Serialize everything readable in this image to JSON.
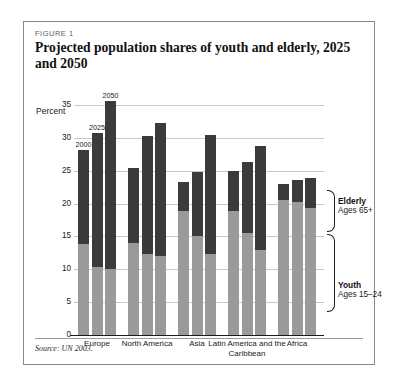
{
  "figure": {
    "label": "FIGURE 1",
    "title": "Projected population shares of youth and elderly, 2025 and 2050",
    "source": "Source: UN 2003."
  },
  "legend": {
    "elderly": {
      "name": "Elderly",
      "sub": "Ages 65+",
      "color": "#3b3b3b"
    },
    "youth": {
      "name": "Youth",
      "sub": "Ages 15–24",
      "color": "#9a9a9a"
    }
  },
  "chart_data": {
    "type": "bar",
    "title": "Projected population shares of youth and elderly, 2025 and 2050",
    "subtype": "stacked-grouped",
    "xlabel": "",
    "ylabel": "Percent",
    "ylim": [
      0,
      35
    ],
    "yticks": [
      0,
      5,
      10,
      15,
      20,
      25,
      30,
      35
    ],
    "grid": true,
    "legend_position": "right",
    "categories": [
      "Europe",
      "North America",
      "Asia",
      "Latin America and the Caribbean",
      "Africa"
    ],
    "year_labels": [
      "2000",
      "2025",
      "2050"
    ],
    "series": [
      {
        "name": "Youth",
        "sublabel": "Ages 15–24",
        "color": "#9a9a9a",
        "values": [
          [
            13.8,
            10.3,
            10.0
          ],
          [
            14.0,
            12.3,
            12.1
          ],
          [
            18.8,
            15.1,
            12.3
          ],
          [
            18.9,
            15.5,
            13.0
          ],
          [
            20.6,
            20.2,
            19.4
          ]
        ]
      },
      {
        "name": "Elderly",
        "sublabel": "Ages 65+",
        "color": "#3b3b3b",
        "values": [
          [
            14.4,
            20.4,
            25.6
          ],
          [
            11.4,
            18.0,
            20.1
          ],
          [
            4.5,
            9.7,
            18.1
          ],
          [
            6.1,
            10.8,
            15.8
          ],
          [
            2.4,
            3.4,
            4.5
          ]
        ]
      }
    ],
    "totals": [
      [
        28.2,
        30.7,
        35.6
      ],
      [
        25.4,
        30.3,
        32.2
      ],
      [
        23.3,
        24.8,
        30.4
      ],
      [
        25.0,
        26.3,
        28.8
      ],
      [
        23.0,
        23.6,
        23.9
      ]
    ],
    "annotations": [
      "2000",
      "2025",
      "2050"
    ],
    "source": "Source: UN 2003."
  }
}
